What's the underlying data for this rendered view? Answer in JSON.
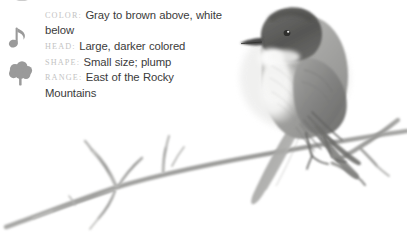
{
  "card": {
    "background_color": "#ffffff",
    "label_color": "#c3c3c3",
    "value_color": "#3b3b3b",
    "icon_color": "#9a9a9a"
  },
  "icons": [
    {
      "name": "palette-icon",
      "glyph": "palette"
    },
    {
      "name": "music-note-icon",
      "glyph": "♪"
    },
    {
      "name": "tree-icon",
      "glyph": "tree"
    }
  ],
  "facts": [
    {
      "label": "Color:",
      "value": "Gray to brown above, white below"
    },
    {
      "label": "Head:",
      "value": "Large, darker colored"
    },
    {
      "label": "Shape:",
      "value": "Small size; plump"
    },
    {
      "label": "Range:",
      "value": "East of the Rocky Mountains"
    }
  ],
  "illustration": {
    "name": "bird-on-branch-illustration",
    "subject": "perched songbird",
    "style": "grayscale pencil drawing",
    "description": "Small plump gray-brown bird with a large dark head and white underside, perched on a bare forked branch"
  }
}
